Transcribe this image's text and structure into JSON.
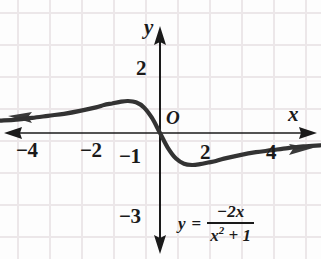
{
  "figure": {
    "background_color": "#fdfdfd",
    "grid_color": "#ece8ea",
    "ink_color": "#1a1a1a",
    "curve_color": "#2b2b2b"
  },
  "axes": {
    "x_label": "x",
    "y_label": "y",
    "origin_label": "O",
    "x_ticks": [
      {
        "label": "−4",
        "value": -4
      },
      {
        "label": "−2",
        "value": -2
      },
      {
        "label": "2",
        "value": 2
      },
      {
        "label": "4",
        "value": 4
      }
    ],
    "y_ticks": [
      {
        "label": "2",
        "value": 2
      },
      {
        "label": "−1",
        "value": -1
      },
      {
        "label": "−3",
        "value": -3
      }
    ],
    "arrows": [
      "left",
      "right",
      "up",
      "down"
    ]
  },
  "equation": {
    "lhs": "y",
    "relation": "=",
    "numerator": "−2x",
    "denominator_base": "x",
    "denominator_exponent": "2",
    "denominator_rest": "+ 1",
    "plain": "y = -2x / (x^2 + 1)"
  },
  "chart_data": {
    "type": "line",
    "xlabel": "x",
    "ylabel": "y",
    "xlim": [
      -5.0,
      5.0
    ],
    "ylim": [
      -3.6,
      3.0
    ],
    "grid": true,
    "legend": "none",
    "xticks": [
      -4,
      -2,
      2,
      4
    ],
    "yticks": [
      2,
      -1,
      -3
    ],
    "annotations": [
      "O at origin",
      "y = -2x/(x^2 + 1) equation label at lower right"
    ],
    "series": [
      {
        "name": "y = -2x/(x^2+1)",
        "x": [
          -5.0,
          -4.5,
          -4.0,
          -3.5,
          -3.0,
          -2.5,
          -2.0,
          -1.75,
          -1.5,
          -1.25,
          -1.0,
          -0.75,
          -0.5,
          -0.25,
          0.0,
          0.25,
          0.5,
          0.75,
          1.0,
          1.25,
          1.5,
          1.75,
          2.0,
          2.5,
          3.0,
          3.5,
          4.0,
          4.5,
          5.0
        ],
        "y": [
          0.385,
          0.419,
          0.471,
          0.538,
          0.6,
          0.69,
          0.8,
          0.875,
          0.923,
          0.976,
          1.0,
          0.96,
          0.8,
          0.471,
          0.0,
          -0.471,
          -0.8,
          -0.96,
          -1.0,
          -0.976,
          -0.923,
          -0.875,
          -0.8,
          -0.69,
          -0.6,
          -0.538,
          -0.471,
          -0.419,
          -0.385
        ]
      }
    ],
    "features": {
      "maximum": {
        "x": -1,
        "y": 1
      },
      "minimum": {
        "x": 1,
        "y": -1
      },
      "x_intercept": {
        "x": 0,
        "y": 0
      },
      "horizontal_asymptote": 0
    }
  },
  "ghost_text": {
    "line1": "",
    "line2": ""
  }
}
